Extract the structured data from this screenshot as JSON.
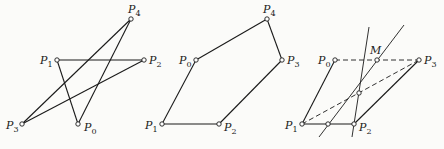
{
  "figures": [
    {
      "id": "fig1",
      "description": "self-intersecting polygon",
      "points": {
        "P0": {
          "x": 78,
          "y": 124,
          "label": "P",
          "sub": "0",
          "lx": 84,
          "ly": 131
        },
        "P1": {
          "x": 57,
          "y": 60,
          "label": "P",
          "sub": "1",
          "lx": 40,
          "ly": 64
        },
        "P2": {
          "x": 144,
          "y": 60,
          "label": "P",
          "sub": "2",
          "lx": 149,
          "ly": 64
        },
        "P3": {
          "x": 22,
          "y": 124,
          "label": "P",
          "sub": "3",
          "lx": 6,
          "ly": 129
        },
        "P4": {
          "x": 131,
          "y": 19,
          "label": "P",
          "sub": "4",
          "lx": 128,
          "ly": 13
        }
      },
      "solid": [
        [
          "P3",
          "P4"
        ],
        [
          "P3",
          "P2"
        ],
        [
          "P1",
          "P2"
        ],
        [
          "P1",
          "P0"
        ],
        [
          "P0",
          "P4"
        ]
      ],
      "dashed": []
    },
    {
      "id": "fig2",
      "description": "convex pentagon",
      "points": {
        "P0": {
          "x": 196,
          "y": 60,
          "label": "P",
          "sub": "0",
          "lx": 179,
          "ly": 64
        },
        "P1": {
          "x": 162,
          "y": 124,
          "label": "P",
          "sub": "1",
          "lx": 145,
          "ly": 129
        },
        "P2": {
          "x": 219,
          "y": 124,
          "label": "P",
          "sub": "2",
          "lx": 224,
          "ly": 131
        },
        "P3": {
          "x": 282,
          "y": 60,
          "label": "P",
          "sub": "3",
          "lx": 287,
          "ly": 64
        },
        "P4": {
          "x": 267,
          "y": 19,
          "label": "P",
          "sub": "4",
          "lx": 263,
          "ly": 13
        }
      },
      "solid": [
        [
          "P0",
          "P4"
        ],
        [
          "P4",
          "P3"
        ],
        [
          "P3",
          "P2"
        ],
        [
          "P2",
          "P1"
        ],
        [
          "P1",
          "P0"
        ]
      ],
      "dashed": []
    },
    {
      "id": "fig3",
      "description": "parallelogram construction with point M",
      "points": {
        "P0": {
          "x": 335,
          "y": 60,
          "label": "P",
          "sub": "0",
          "lx": 318,
          "ly": 64
        },
        "P1": {
          "x": 302,
          "y": 124,
          "label": "P",
          "sub": "1",
          "lx": 285,
          "ly": 129
        },
        "P2": {
          "x": 354,
          "y": 124,
          "label": "P",
          "sub": "2",
          "lx": 359,
          "ly": 131
        },
        "P3": {
          "x": 419,
          "y": 60,
          "label": "P",
          "sub": "3",
          "lx": 424,
          "ly": 64
        },
        "M": {
          "x": 377,
          "y": 60,
          "label": "M",
          "sub": "",
          "lx": 370,
          "ly": 54
        },
        "Q": {
          "x": 359,
          "y": 93,
          "label": "",
          "sub": "",
          "lx": 0,
          "ly": 0
        },
        "R": {
          "x": 328,
          "y": 124,
          "label": "",
          "sub": "",
          "lx": 0,
          "ly": 0
        }
      },
      "solid": [
        [
          "P0",
          "P1"
        ],
        [
          "P1",
          "P2"
        ],
        [
          "P2",
          "P3"
        ]
      ],
      "dashed": [
        [
          "P0",
          "P3"
        ],
        [
          "P1",
          "P3"
        ]
      ],
      "extra_lines": [
        {
          "x1": 319,
          "y1": 137,
          "x2": 404,
          "y2": 25
        },
        {
          "x1": 352,
          "y1": 137,
          "x2": 369,
          "y2": 27
        }
      ]
    }
  ],
  "colors": {
    "line": "#1a1a1a",
    "background": "#fbfbf9"
  }
}
